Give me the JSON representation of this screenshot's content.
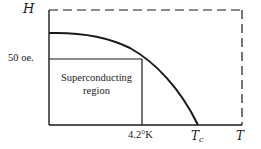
{
  "diagram": {
    "type": "phase-diagram",
    "y_axis_label": "H",
    "x_axis_label": "T",
    "y_tick_label": "50 oe.",
    "x_tick_label": "4.2°K",
    "critical_temperature_label": "T",
    "critical_temperature_subscript": "c",
    "region_label_line1": "Superconducting",
    "region_label_line2": "region",
    "line_color": "#1a1a1a",
    "background_color": "#ffffff",
    "bounding_box_style": "dashed"
  }
}
